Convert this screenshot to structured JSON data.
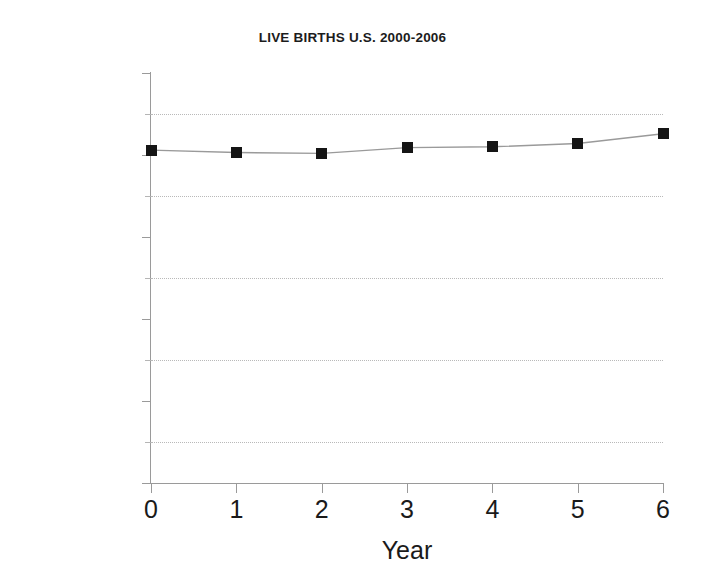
{
  "chart_data": {
    "type": "line",
    "title": "LIVE BIRTHS U.S. 2000-2006",
    "xlabel": "Year",
    "ylabel": "",
    "x": [
      0,
      1,
      2,
      3,
      4,
      5,
      6
    ],
    "values": [
      4060000,
      4030000,
      4020000,
      4090000,
      4100000,
      4140000,
      4260000
    ],
    "series": [
      {
        "name": "Live Births",
        "values": [
          4060000,
          4030000,
          4020000,
          4090000,
          4100000,
          4140000,
          4260000
        ]
      }
    ],
    "categories": [
      "0",
      "1",
      "2",
      "3",
      "4",
      "5",
      "6"
    ],
    "xlim": [
      0,
      6
    ],
    "ylim": [
      0,
      5000000
    ],
    "x_ticks": [
      "0",
      "1",
      "2",
      "3",
      "4",
      "5",
      "6"
    ],
    "y_ticks": [
      "0",
      "1000000",
      "2000000",
      "3000000",
      "4000000",
      "5000000"
    ],
    "y_tick_values": [
      0,
      1000000,
      2000000,
      3000000,
      4000000,
      5000000
    ],
    "y_minor_gridlines": [
      500000,
      1500000,
      2500000,
      3500000,
      4500000
    ],
    "grid": true,
    "grid_style": "dotted-horizontal-minor",
    "legend": null,
    "legend_position": "none",
    "marker": "square",
    "marker_color": "#151515",
    "line_color": "#9a9a9a",
    "grid_color": "#b9b9b9",
    "axis_color": "#9a9a9a",
    "background": "#ffffff"
  }
}
